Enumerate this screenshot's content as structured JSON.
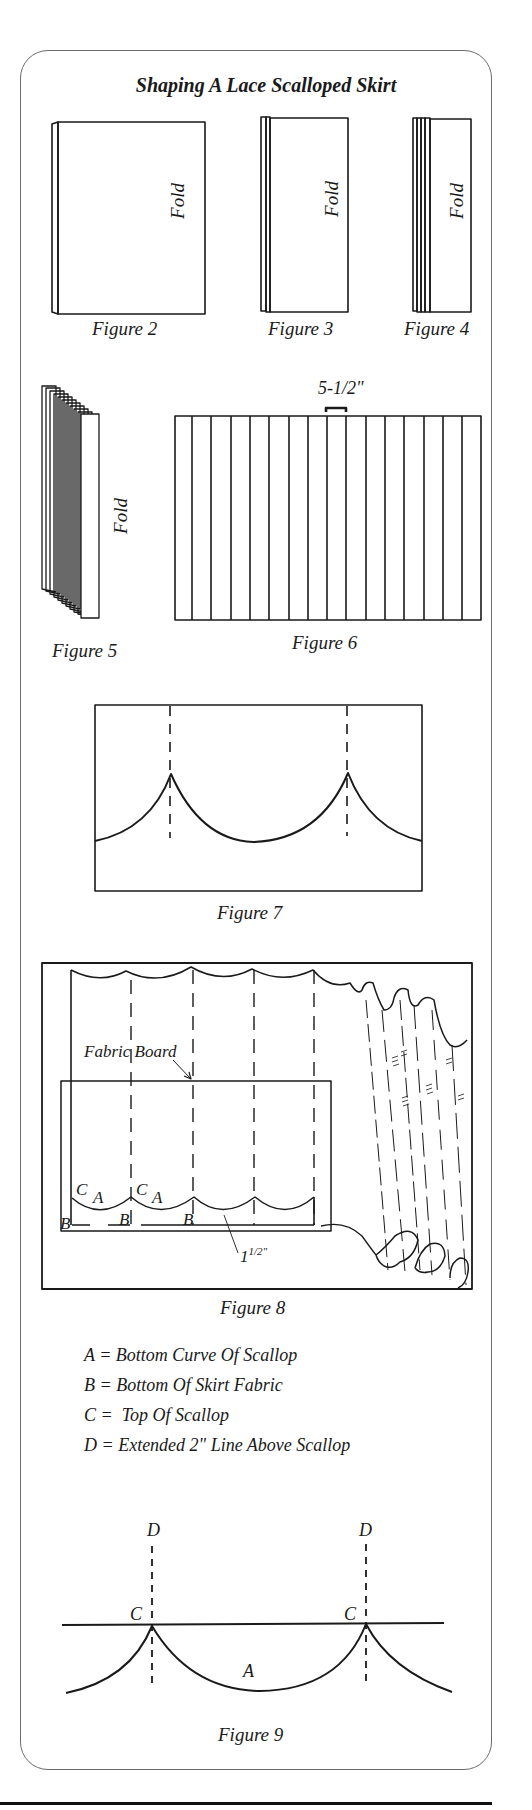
{
  "document": {
    "title": "Shaping A Lace Scalloped Skirt",
    "fold_label": "Fold",
    "figures": {
      "fig2": {
        "caption": "Figure 2"
      },
      "fig3": {
        "caption": "Figure 3"
      },
      "fig4": {
        "caption": "Figure 4"
      },
      "fig5": {
        "caption": "Figure 5"
      },
      "fig6": {
        "caption": "Figure 6",
        "measure_label": "5-1/2\"",
        "column_count": 16
      },
      "fig7": {
        "caption": "Figure 7"
      },
      "fig8": {
        "caption": "Figure 8",
        "board_label": "Fabric Board",
        "measure_label_whole": "1",
        "measure_label_fraction": "1/2\"",
        "point_labels": [
          "C",
          "A",
          "C",
          "A",
          "B",
          "B",
          "B"
        ]
      },
      "fig9": {
        "caption": "Figure 9",
        "labels": {
          "d": "D",
          "c": "C",
          "a": "A"
        }
      }
    },
    "legend": [
      {
        "key": "A",
        "text": "A = Bottom Curve Of Scallop"
      },
      {
        "key": "B",
        "text": "B = Bottom Of Skirt Fabric"
      },
      {
        "key": "C",
        "text": "C =  Top Of Scallop"
      },
      {
        "key": "D",
        "text": "D = Extended 2\" Line Above Scallop"
      }
    ]
  }
}
